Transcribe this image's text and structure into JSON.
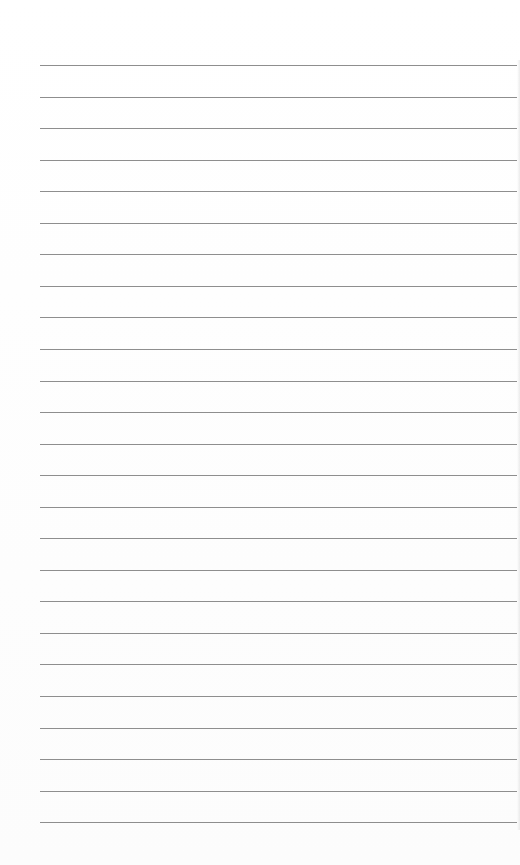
{
  "page": {
    "type": "blank lined paper",
    "line_count": 25,
    "first_line_y": 65,
    "line_spacing": 31.55,
    "line_left": 40,
    "line_width": 477,
    "line_color": "#8e8e8e",
    "background_color": "#fefefe"
  }
}
